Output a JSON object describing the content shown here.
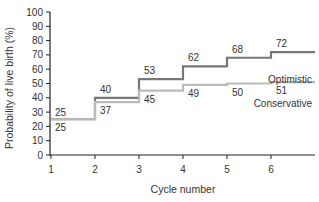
{
  "chart_data": {
    "type": "line",
    "step": true,
    "title": "",
    "xlabel": "Cycle number",
    "ylabel": "Probability of live birth (%)",
    "x": [
      1,
      2,
      3,
      4,
      5,
      6
    ],
    "xticks": [
      "1",
      "2",
      "3",
      "4",
      "5",
      "6"
    ],
    "yticks": [
      "0",
      "10",
      "20",
      "30",
      "40",
      "50",
      "60",
      "70",
      "80",
      "90",
      "100"
    ],
    "ylim": [
      0,
      100
    ],
    "xlim": [
      1,
      7
    ],
    "grid": false,
    "legend": "inline labels",
    "series": [
      {
        "name": "Optimistic",
        "values": [
          25,
          40,
          53,
          62,
          68,
          72
        ],
        "color": "#777777"
      },
      {
        "name": "Conservative",
        "values": [
          25,
          37,
          45,
          49,
          50,
          51
        ],
        "color": "#bbbbbb"
      }
    ]
  }
}
